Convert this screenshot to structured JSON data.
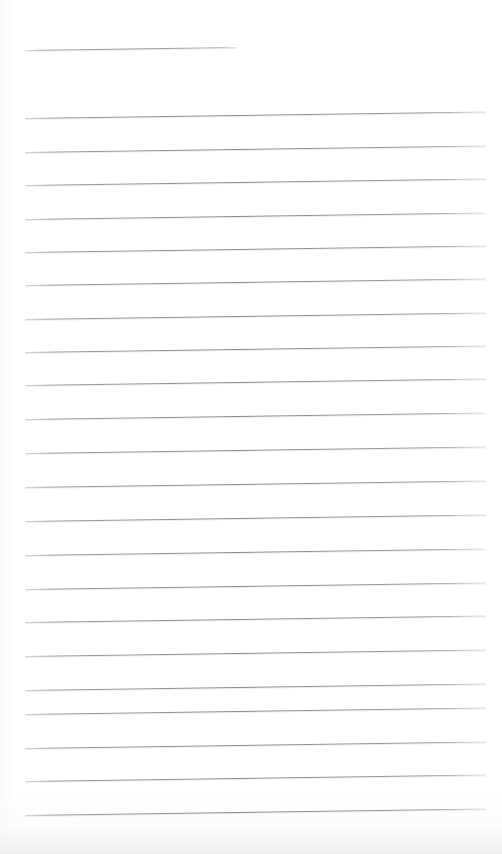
{
  "document": {
    "kind": "scanned-blank-lined-paper",
    "title": "",
    "page_width": 502,
    "page_height": 854,
    "background_color": "#ffffff",
    "rule_color": "#8c8c8c",
    "rule_thickness_px": 1,
    "left_margin_px": 25,
    "right_margin_px": 486,
    "line_spacing_px": 33.4,
    "scan_slant_deg": -0.8,
    "line_count": 23,
    "text_content": "",
    "notes_written": "none"
  },
  "lines": [
    {
      "index": 1,
      "label": "header-rule",
      "y": 50,
      "x_start": 25,
      "x_end": 237,
      "full_width": false
    },
    {
      "index": 2,
      "label": "rule",
      "y": 118,
      "x_start": 25,
      "x_end": 486,
      "full_width": true
    },
    {
      "index": 3,
      "label": "rule",
      "y": 152,
      "x_start": 25,
      "x_end": 486,
      "full_width": true
    },
    {
      "index": 4,
      "label": "rule",
      "y": 185,
      "x_start": 25,
      "x_end": 486,
      "full_width": true
    },
    {
      "index": 5,
      "label": "rule",
      "y": 219,
      "x_start": 25,
      "x_end": 486,
      "full_width": true
    },
    {
      "index": 6,
      "label": "rule",
      "y": 252,
      "x_start": 25,
      "x_end": 486,
      "full_width": true
    },
    {
      "index": 7,
      "label": "rule",
      "y": 285,
      "x_start": 25,
      "x_end": 486,
      "full_width": true
    },
    {
      "index": 8,
      "label": "rule",
      "y": 319,
      "x_start": 25,
      "x_end": 486,
      "full_width": true
    },
    {
      "index": 9,
      "label": "rule",
      "y": 352,
      "x_start": 25,
      "x_end": 486,
      "full_width": true
    },
    {
      "index": 10,
      "label": "rule",
      "y": 385,
      "x_start": 25,
      "x_end": 486,
      "full_width": true
    },
    {
      "index": 11,
      "label": "rule",
      "y": 419,
      "x_start": 25,
      "x_end": 486,
      "full_width": true
    },
    {
      "index": 12,
      "label": "rule",
      "y": 453,
      "x_start": 25,
      "x_end": 486,
      "full_width": true
    },
    {
      "index": 13,
      "label": "rule",
      "y": 487,
      "x_start": 25,
      "x_end": 486,
      "full_width": true
    },
    {
      "index": 14,
      "label": "rule",
      "y": 521,
      "x_start": 25,
      "x_end": 486,
      "full_width": true
    },
    {
      "index": 15,
      "label": "rule",
      "y": 555,
      "x_start": 25,
      "x_end": 486,
      "full_width": true
    },
    {
      "index": 16,
      "label": "rule",
      "y": 589,
      "x_start": 25,
      "x_end": 486,
      "full_width": true
    },
    {
      "index": 17,
      "label": "rule",
      "y": 622,
      "x_start": 25,
      "x_end": 486,
      "full_width": true
    },
    {
      "index": 18,
      "label": "rule",
      "y": 656,
      "x_start": 25,
      "x_end": 486,
      "full_width": true
    },
    {
      "index": 19,
      "label": "rule",
      "y": 690,
      "x_start": 25,
      "x_end": 486,
      "full_width": true
    },
    {
      "index": 20,
      "label": "rule",
      "y": 714,
      "x_start": 25,
      "x_end": 486,
      "full_width": true
    },
    {
      "index": 21,
      "label": "rule",
      "y": 748,
      "x_start": 25,
      "x_end": 486,
      "full_width": true
    },
    {
      "index": 22,
      "label": "rule",
      "y": 781,
      "x_start": 25,
      "x_end": 486,
      "full_width": true
    },
    {
      "index": 23,
      "label": "rule",
      "y": 815,
      "x_start": 25,
      "x_end": 486,
      "full_width": true
    }
  ]
}
